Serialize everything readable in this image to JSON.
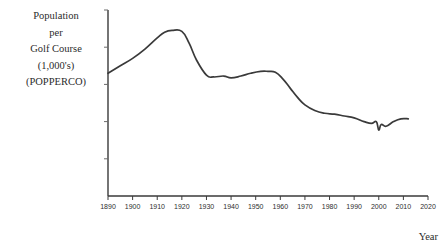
{
  "chart_data": {
    "type": "line",
    "title": "",
    "ylabel_lines": [
      "Population",
      "per",
      "Golf Course",
      "(1,000's)",
      "(POPPERCO)"
    ],
    "xlabel": "Year",
    "xtick_labels": [
      "1890",
      "1900",
      "1910",
      "1920",
      "1930",
      "1940",
      "1950",
      "1960",
      "1970",
      "1980",
      "1990",
      "2000",
      "2010",
      "2020"
    ],
    "xlim": [
      1890,
      2020
    ],
    "ylim": [
      0,
      10
    ],
    "grid": false,
    "legend": null,
    "y_axis_ticks_labeled": false,
    "series": [
      {
        "name": "Population per Golf Course (1,000's)",
        "color": "#3a3a3a",
        "x": [
          1890,
          1895,
          1900,
          1905,
          1910,
          1913,
          1916,
          1920,
          1923,
          1926,
          1930,
          1933,
          1937,
          1940,
          1944,
          1948,
          1952,
          1955,
          1958,
          1961,
          1964,
          1967,
          1970,
          1974,
          1978,
          1982,
          1986,
          1990,
          1994,
          1997,
          1999,
          2000,
          2001,
          2003,
          2006,
          2009,
          2012
        ],
        "y": [
          6.6,
          7.0,
          7.4,
          7.9,
          8.5,
          8.8,
          8.9,
          8.85,
          8.2,
          7.3,
          6.5,
          6.4,
          6.45,
          6.35,
          6.45,
          6.6,
          6.7,
          6.7,
          6.65,
          6.3,
          5.8,
          5.3,
          4.9,
          4.6,
          4.45,
          4.4,
          4.3,
          4.2,
          4.0,
          3.9,
          4.0,
          3.55,
          3.85,
          3.75,
          4.0,
          4.15,
          4.15
        ]
      }
    ]
  }
}
